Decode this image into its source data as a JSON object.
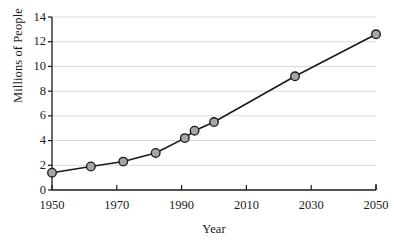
{
  "chart_data": {
    "type": "line",
    "title": "",
    "subtitle": "",
    "xlabel": "Year",
    "ylabel": "Millions of People",
    "xlim": [
      1950,
      2050
    ],
    "ylim": [
      0,
      14
    ],
    "xticks": [
      1950,
      1970,
      1990,
      2010,
      2030,
      2050
    ],
    "yticks": [
      0,
      2,
      4,
      6,
      8,
      10,
      12,
      14
    ],
    "xtick_labels": [
      "1950",
      "1970",
      "1990",
      "2010",
      "2030",
      "2050"
    ],
    "ytick_labels": [
      "0",
      "2",
      "4",
      "6",
      "8",
      "10",
      "12",
      "14"
    ],
    "grid": "horizontal",
    "legend": "none",
    "series": [
      {
        "name": "Millions of People",
        "marker": "circle",
        "marker_fill": "#a6a6a6",
        "marker_edge": "#1a1a1a",
        "line_color": "#1a1a1a",
        "x": [
          1950,
          1962,
          1972,
          1982,
          1991,
          1994,
          2000,
          2025,
          2050
        ],
        "values": [
          1.4,
          1.9,
          2.3,
          3.0,
          4.2,
          4.8,
          5.5,
          9.2,
          12.6
        ]
      }
    ],
    "annotations": []
  },
  "style": {
    "background": "#ffffff",
    "axis_color": "#1a1a1a",
    "grid_color": "#d9d9d9",
    "text_color": "#1a1a1a"
  }
}
